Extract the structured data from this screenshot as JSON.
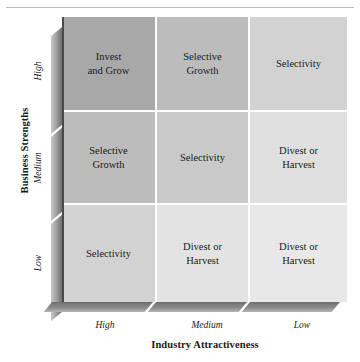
{
  "figure": {
    "name": "ge-mckinsey-nine-box-matrix",
    "top_rule": "horizontal-rule"
  },
  "axes": {
    "y": {
      "title": "Business Strengths",
      "ticks": [
        "High",
        "Medium",
        "Low"
      ]
    },
    "x": {
      "title": "Industry Attractiveness",
      "ticks": [
        "High",
        "Medium",
        "Low"
      ]
    }
  },
  "colors": {
    "darkest": "#a8a8a8",
    "dark": "#bcbcbc",
    "mid": "#cccccc",
    "light": "#d6d6d6",
    "lightest": "#e8e8e8",
    "grid_line": "#ffffff",
    "text": "#1a1a1a",
    "extrude_dark": "#6e6e6e",
    "extrude_light": "#c9c9c9"
  },
  "chart_data": {
    "type": "heatmap",
    "title": "",
    "xlabel": "Industry Attractiveness",
    "ylabel": "Business Strengths",
    "x_categories": [
      "High",
      "Medium",
      "Low"
    ],
    "y_categories": [
      "High",
      "Medium",
      "Low"
    ],
    "grid": true,
    "legend": "none",
    "cells": [
      {
        "row": "High",
        "col": "High",
        "label": "Invest\nand Grow",
        "shade": 1,
        "color": "#a8a8a8"
      },
      {
        "row": "High",
        "col": "Medium",
        "label": "Selective\nGrowth",
        "shade": 2,
        "color": "#bcbcbc"
      },
      {
        "row": "High",
        "col": "Low",
        "label": "Selectivity",
        "shade": 3,
        "color": "#d2d2d2"
      },
      {
        "row": "Medium",
        "col": "High",
        "label": "Selective\nGrowth",
        "shade": 2,
        "color": "#bcbcbc"
      },
      {
        "row": "Medium",
        "col": "Medium",
        "label": "Selectivity",
        "shade": 3,
        "color": "#c9c9c9"
      },
      {
        "row": "Medium",
        "col": "Low",
        "label": "Divest or\nHarvest",
        "shade": 4,
        "color": "#e0e0e0"
      },
      {
        "row": "Low",
        "col": "High",
        "label": "Selectivity",
        "shade": 3,
        "color": "#d2d2d2"
      },
      {
        "row": "Low",
        "col": "Medium",
        "label": "Divest or\nHarvest",
        "shade": 4,
        "color": "#e3e3e3"
      },
      {
        "row": "Low",
        "col": "Low",
        "label": "Divest or\nHarvest",
        "shade": 5,
        "color": "#e8e8e8"
      }
    ]
  }
}
